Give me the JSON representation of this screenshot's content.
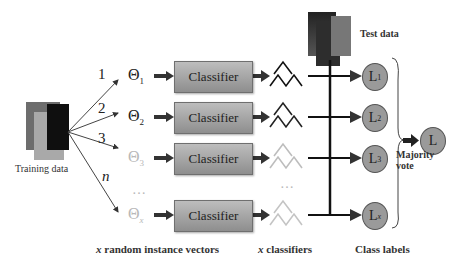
{
  "figure": {
    "training_label": "Training data",
    "test_label": "Test data",
    "branches": [
      {
        "number": "1",
        "vector": "Θ",
        "subscript": "1",
        "faded": false
      },
      {
        "number": "2",
        "vector": "Θ",
        "subscript": "2",
        "faded": false
      },
      {
        "number": "3",
        "vector": "Θ",
        "subscript": "3",
        "faded": true
      },
      {
        "number": "n",
        "vector": "Θ",
        "subscript": "x",
        "faded": true
      }
    ],
    "classifier_label": "Classifier",
    "ellipsis": "…",
    "class_labels": [
      {
        "main": "L",
        "sub": "1"
      },
      {
        "main": "L",
        "sub": "2"
      },
      {
        "main": "L",
        "sub": "3"
      },
      {
        "main": "L",
        "sub": "x"
      }
    ],
    "final_label": "L",
    "majority_vote": [
      "Majority",
      "vote"
    ],
    "bottom_labels": {
      "vectors_italic": "x",
      "vectors_rest": " random instance vectors",
      "classifiers_italic": "x",
      "classifiers_rest": " classifiers",
      "class_labels": "Class labels"
    },
    "colors": {
      "classifier_fill": "#a5a5a5",
      "circle_fill": "#9a9a9a",
      "dark": "#1a1a1a",
      "faded": "#b8b8b8"
    }
  }
}
